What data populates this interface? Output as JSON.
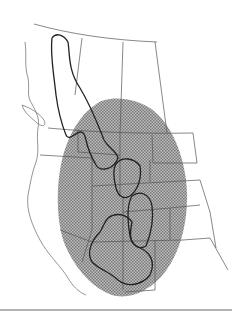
{
  "figure": {
    "type": "range-map",
    "region": "Western North America",
    "colors": {
      "background": "#ffffff",
      "stipple": "#8a8a8a",
      "borders": "#555555",
      "outline": "#222222"
    },
    "layers": [
      {
        "name": "stippled-range",
        "description": "Broad oval shaded distribution area"
      },
      {
        "name": "northern-outline",
        "description": "Narrow outlined range extending north into Canada"
      },
      {
        "name": "southern-outlines",
        "description": "Outlined sub-ranges in the central/southern Rockies and Colorado Plateau"
      },
      {
        "name": "political-borders",
        "description": "State and provincial boundaries"
      }
    ]
  }
}
